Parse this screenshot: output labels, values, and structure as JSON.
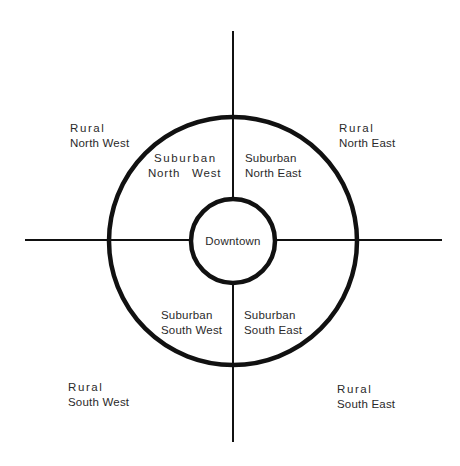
{
  "diagram": {
    "type": "concentric-zone-map",
    "colors": {
      "stroke": "#111111",
      "text": "#2a2a2a",
      "background": "#ffffff"
    },
    "center": {
      "label": "Downtown"
    },
    "suburban": [
      {
        "line1": "Suburban",
        "line2": "North   West",
        "quadrant": "NW"
      },
      {
        "line1": "Suburban",
        "line2": "North East",
        "quadrant": "NE"
      },
      {
        "line1": "Suburban",
        "line2": "South West",
        "quadrant": "SW"
      },
      {
        "line1": "Suburban",
        "line2": "South East",
        "quadrant": "SE"
      }
    ],
    "rural": [
      {
        "line1": "Rural",
        "line2": "North West",
        "quadrant": "NW"
      },
      {
        "line1": "Rural",
        "line2": "North East",
        "quadrant": "NE"
      },
      {
        "line1": "Rural",
        "line2": "South West",
        "quadrant": "SW"
      },
      {
        "line1": "Rural",
        "line2": "South East",
        "quadrant": "SE"
      }
    ]
  }
}
